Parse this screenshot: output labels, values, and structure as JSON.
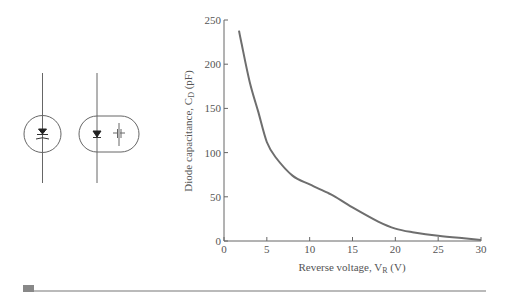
{
  "symbols": {
    "left": {
      "name": "varactor-symbol-circle"
    },
    "right": {
      "name": "varactor-equivalent-capsule"
    }
  },
  "chart_data": {
    "type": "line",
    "title": "",
    "xlabel": "Reverse voltage, V_R (V)",
    "ylabel": "Diode capacitance, C_D (pF)",
    "xlim": [
      0,
      30
    ],
    "ylim": [
      0,
      250
    ],
    "xticks": [
      0,
      5,
      10,
      15,
      20,
      25,
      30
    ],
    "yticks": [
      0,
      50,
      100,
      150,
      200,
      250
    ],
    "grid": false,
    "legend": null,
    "series": [
      {
        "name": "C_D vs V_R",
        "color": "#6e6e6e",
        "x": [
          1.75,
          2,
          3,
          4,
          5,
          6,
          8,
          10,
          12,
          13,
          15,
          18,
          20,
          22,
          25,
          28,
          30
        ],
        "y": [
          238,
          226,
          180,
          146,
          112,
          95,
          74,
          64,
          55,
          50,
          38,
          22,
          14,
          10,
          6,
          3,
          1
        ]
      }
    ]
  },
  "labels": {
    "xlabel_main": "Reverse voltage, V",
    "xlabel_sub": "R",
    "xlabel_unit": " (V)",
    "ylabel_main": "Diode capacitance, C",
    "ylabel_sub": "D",
    "ylabel_unit": " (pF)"
  },
  "footer": {
    "rule_color": "#777777",
    "marker_color": "#888888"
  }
}
